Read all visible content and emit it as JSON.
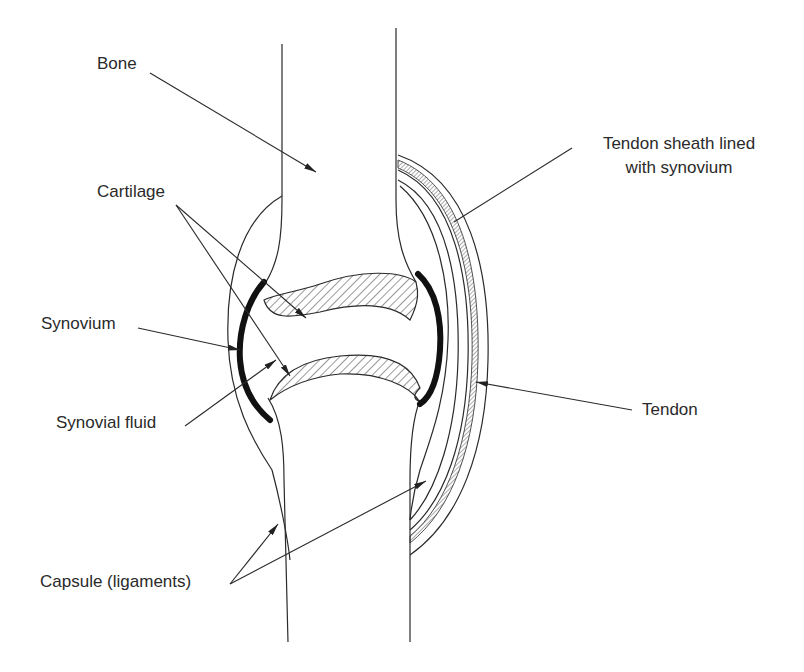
{
  "diagram": {
    "labels": {
      "bone": "Bone",
      "cartilage": "Cartilage",
      "synovium": "Synovium",
      "synovial_fluid": "Synovial fluid",
      "capsule": "Capsule (ligaments)",
      "tendon_sheath_line1": "Tendon sheath lined",
      "tendon_sheath_line2": "with synovium",
      "tendon": "Tendon"
    },
    "colors": {
      "line": "#2a2a2a",
      "background": "#ffffff"
    }
  }
}
